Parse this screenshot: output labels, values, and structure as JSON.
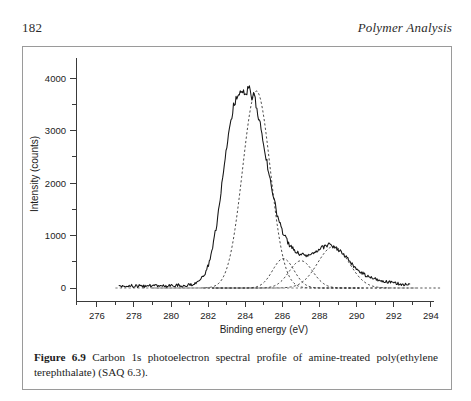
{
  "page": {
    "folio": "182",
    "running_title": "Polymer Analysis"
  },
  "caption": {
    "label": "Figure 6.9",
    "text": " Carbon 1s photoelectron spectral profile of amine-treated poly(ethylene terephthalate) (SAQ 6.3)."
  },
  "chart_data": {
    "type": "line",
    "title": "",
    "xlabel": "Binding energy (eV)",
    "ylabel": "Intensity (counts)",
    "xlim": [
      275.2,
      294.6
    ],
    "ylim": [
      -130,
      4350
    ],
    "xticks": [
      276,
      278,
      280,
      282,
      284,
      286,
      288,
      290,
      292,
      294
    ],
    "xticklabels": [
      "276",
      "278",
      "280",
      "282",
      "284",
      "286",
      "288",
      "290",
      "292",
      "294"
    ],
    "xminorticks": [
      277,
      279,
      281,
      283,
      285,
      287,
      289,
      291,
      293
    ],
    "yticks": [
      0,
      1000,
      2000,
      3000,
      4000
    ],
    "yticklabels": [
      "0",
      "1000",
      "2000",
      "3000",
      "4000"
    ],
    "yminorticks": [
      500,
      1500,
      2500,
      3500
    ],
    "grid": false,
    "legend": null,
    "series": [
      {
        "name": "measured spectrum",
        "style": "solid",
        "x": [
          277.2,
          277.5,
          277.8,
          278.0,
          278.3,
          278.6,
          278.9,
          279.2,
          279.5,
          279.8,
          280.1,
          280.4,
          280.7,
          281.0,
          281.3,
          281.5,
          281.8,
          282.0,
          282.2,
          282.4,
          282.6,
          282.8,
          283.0,
          283.2,
          283.4,
          283.6,
          283.8,
          284.0,
          284.2,
          284.35,
          284.5,
          284.6,
          284.75,
          284.9,
          285.1,
          285.3,
          285.5,
          285.8,
          286.1,
          286.4,
          286.7,
          287.0,
          287.3,
          287.6,
          287.9,
          288.2,
          288.5,
          288.8,
          289.1,
          289.4,
          289.7,
          290.0,
          290.3,
          290.6,
          290.9,
          291.3,
          291.7,
          292.1,
          292.5,
          292.9
        ],
        "y": [
          40,
          30,
          45,
          35,
          40,
          30,
          45,
          35,
          50,
          40,
          45,
          55,
          45,
          60,
          90,
          150,
          260,
          430,
          700,
          1100,
          1600,
          2150,
          2700,
          3150,
          3500,
          3680,
          3790,
          3700,
          3830,
          3600,
          3730,
          3480,
          3200,
          2900,
          2500,
          2100,
          1750,
          1300,
          1000,
          820,
          700,
          640,
          620,
          640,
          700,
          780,
          830,
          790,
          700,
          600,
          470,
          360,
          280,
          220,
          180,
          140,
          110,
          90,
          70,
          55
        ]
      },
      {
        "name": "component 1 (284.6 eV, C-C/C-H)",
        "style": "dashed",
        "center": 284.6,
        "height": 3760,
        "fwhm": 1.75
      },
      {
        "name": "component 2 (286.0 eV)",
        "style": "dashed",
        "center": 286.05,
        "height": 560,
        "fwhm": 1.35
      },
      {
        "name": "component 3 (287.0 eV)",
        "style": "dashed",
        "center": 287.0,
        "height": 520,
        "fwhm": 1.5
      },
      {
        "name": "component 4 (288.8 eV, ester C=O)",
        "style": "dashed",
        "center": 288.75,
        "height": 790,
        "fwhm": 2.0
      },
      {
        "name": "baseline",
        "style": "dashed",
        "y": 0
      }
    ]
  }
}
